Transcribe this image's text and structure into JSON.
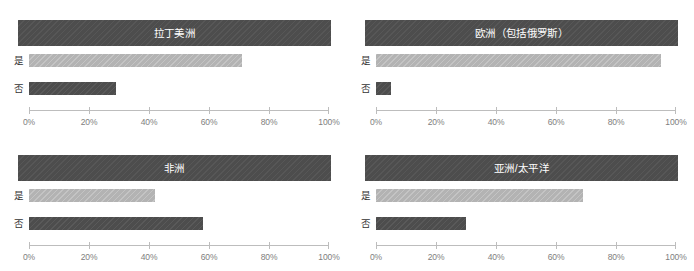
{
  "chart_data": {
    "type": "bar",
    "title": "",
    "orientation": "horizontal",
    "categories": [
      "是",
      "否"
    ],
    "xlabel": "",
    "ylabel": "",
    "xlim": [
      0,
      100
    ],
    "xticks": [
      0,
      20,
      40,
      60,
      80,
      100
    ],
    "xtick_labels": [
      "0%",
      "20%",
      "40%",
      "60%",
      "80%",
      "100%"
    ],
    "grid": false,
    "legend": "none",
    "colors": {
      "yes_bar": "#b3b3b3",
      "no_bar": "#4d4d4d",
      "panel_header": "#4d4d4d",
      "axis": "#bdbdbd",
      "tick_text": "#808080",
      "header_text": "#ffffff",
      "label_text": "#333333",
      "background": "#ffffff"
    },
    "panels": [
      {
        "title": "拉丁美洲",
        "values": [
          71,
          29
        ],
        "bars": [
          {
            "label": "是",
            "value": 71
          },
          {
            "label": "否",
            "value": 29
          }
        ]
      },
      {
        "title": "欧洲（包括俄罗斯）",
        "values": [
          95,
          5
        ],
        "bars": [
          {
            "label": "是",
            "value": 95
          },
          {
            "label": "否",
            "value": 5
          }
        ]
      },
      {
        "title": "非洲",
        "values": [
          42,
          58
        ],
        "bars": [
          {
            "label": "是",
            "value": 42
          },
          {
            "label": "否",
            "value": 58
          }
        ]
      },
      {
        "title": "亚洲/太平洋",
        "values": [
          69,
          30
        ],
        "bars": [
          {
            "label": "是",
            "value": 69
          },
          {
            "label": "否",
            "value": 30
          }
        ]
      }
    ]
  }
}
